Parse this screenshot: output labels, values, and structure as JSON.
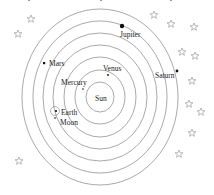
{
  "diagram": {
    "title_cropped": "",
    "center": {
      "x": 100,
      "y": 97
    },
    "orbits_rx": [
      14,
      25,
      36,
      47,
      57,
      67,
      78
    ],
    "orbits_ry": [
      15,
      27,
      40,
      52,
      64,
      76,
      88
    ],
    "colors": {
      "orbit": "#6e6e6e",
      "star": "#8a8a8a",
      "planet": "#111111",
      "text": "#222222"
    },
    "bodies": {
      "sun": {
        "label": "Sun"
      },
      "mercury": {
        "label": "Mercury"
      },
      "venus": {
        "label": "Venus"
      },
      "earth": {
        "label": "Earth"
      },
      "moon": {
        "label": "Moon"
      },
      "mars": {
        "label": "Mars"
      },
      "jupiter": {
        "label": "Jupiter"
      },
      "saturn": {
        "label": "Saturn"
      }
    },
    "stars_count": 13
  }
}
